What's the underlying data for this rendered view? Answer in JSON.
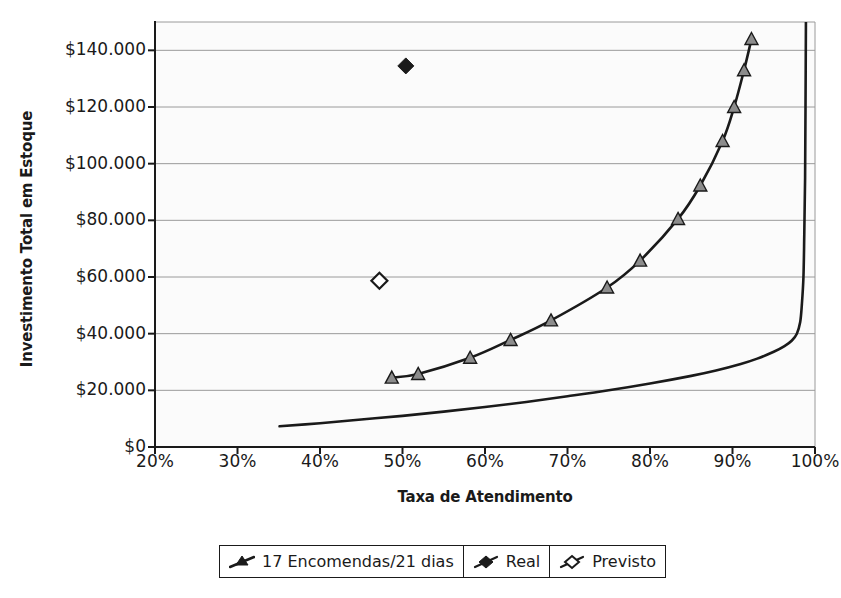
{
  "chart_data": {
    "type": "line",
    "title": "",
    "xlabel": "Taxa de Atendimento",
    "ylabel": "Investimento Total em Estoque",
    "xlim": [
      20,
      100
    ],
    "ylim": [
      0,
      150000
    ],
    "xticks": [
      "20%",
      "30%",
      "40%",
      "50%",
      "60%",
      "70%",
      "80%",
      "90%",
      "100%"
    ],
    "xtick_values": [
      20,
      30,
      40,
      50,
      60,
      70,
      80,
      90,
      100
    ],
    "yticks": [
      "$0",
      "$20.000",
      "$40.000",
      "$60.000",
      "$80.000",
      "$100.000",
      "$120.000",
      "$140.000"
    ],
    "ytick_values": [
      0,
      20000,
      40000,
      60000,
      80000,
      100000,
      120000,
      140000
    ],
    "grid": true,
    "legend_position": "bottom",
    "series": [
      {
        "name": "17 Encomendas/21 dias",
        "marker": "triangle",
        "color": "#1a1a1a",
        "marker_fill": "#8c8c8c",
        "points": [
          {
            "x": 48.7,
            "y": 24500
          },
          {
            "x": 51.9,
            "y": 25800
          },
          {
            "x": 58.2,
            "y": 31500
          },
          {
            "x": 63.1,
            "y": 37800
          },
          {
            "x": 68.0,
            "y": 44700
          },
          {
            "x": 74.8,
            "y": 56300
          },
          {
            "x": 78.8,
            "y": 65800
          },
          {
            "x": 83.4,
            "y": 80500
          },
          {
            "x": 86.1,
            "y": 92300
          },
          {
            "x": 88.8,
            "y": 108000
          },
          {
            "x": 90.2,
            "y": 120000
          },
          {
            "x": 91.4,
            "y": 133000
          },
          {
            "x": 92.3,
            "y": 144000
          }
        ]
      },
      {
        "name": "Curva inferior",
        "marker": "none",
        "color": "#1a1a1a",
        "points": [
          {
            "x": 35.1,
            "y": 7300
          },
          {
            "x": 40.0,
            "y": 8400
          },
          {
            "x": 45.0,
            "y": 9700
          },
          {
            "x": 50.0,
            "y": 11000
          },
          {
            "x": 55.0,
            "y": 12500
          },
          {
            "x": 60.0,
            "y": 14100
          },
          {
            "x": 65.0,
            "y": 15900
          },
          {
            "x": 70.0,
            "y": 17900
          },
          {
            "x": 75.0,
            "y": 20000
          },
          {
            "x": 80.0,
            "y": 22400
          },
          {
            "x": 85.0,
            "y": 25100
          },
          {
            "x": 88.0,
            "y": 27000
          },
          {
            "x": 91.0,
            "y": 29300
          },
          {
            "x": 93.0,
            "y": 31200
          },
          {
            "x": 95.0,
            "y": 33600
          },
          {
            "x": 96.3,
            "y": 35600
          },
          {
            "x": 97.2,
            "y": 37600
          },
          {
            "x": 97.8,
            "y": 40000
          },
          {
            "x": 98.2,
            "y": 44000
          },
          {
            "x": 98.4,
            "y": 50000
          },
          {
            "x": 98.6,
            "y": 60000
          },
          {
            "x": 98.7,
            "y": 75000
          },
          {
            "x": 98.8,
            "y": 95000
          },
          {
            "x": 98.85,
            "y": 120000
          },
          {
            "x": 98.9,
            "y": 150000
          }
        ]
      },
      {
        "name": "Real",
        "marker": "diamond-filled",
        "color": "#1a1a1a",
        "points": [
          {
            "x": 50.4,
            "y": 134500
          }
        ]
      },
      {
        "name": "Previsto",
        "marker": "diamond-open",
        "color": "#1a1a1a",
        "points": [
          {
            "x": 47.2,
            "y": 58700
          }
        ]
      }
    ],
    "legend_entries": [
      {
        "label": "17 Encomendas/21 dias",
        "marker": "triangle-line"
      },
      {
        "label": "Real",
        "marker": "diamond-filled"
      },
      {
        "label": "Previsto",
        "marker": "diamond-open"
      }
    ]
  },
  "colors": {
    "axis": "#1a1a1a",
    "grid": "#9a9a9a",
    "plot_background": "#fbfbfb",
    "marker_fill": "#8c8c8c",
    "series_line": "#1a1a1a"
  }
}
